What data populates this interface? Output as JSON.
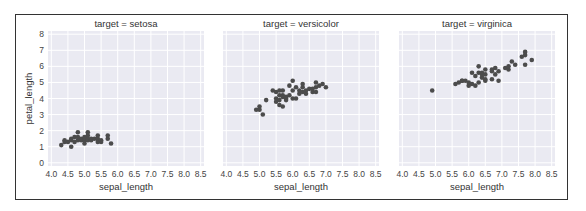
{
  "chart_data": {
    "type": "scatter",
    "layout": "facet-grid 1x3, shared axes",
    "xlabel": "sepal_length",
    "ylabel": "petal_length",
    "xticks": [
      "4.0",
      "4.5",
      "5.0",
      "5.5",
      "6.0",
      "6.5",
      "7.0",
      "7.5",
      "8.0",
      "8.5"
    ],
    "yticks": [
      "0",
      "1",
      "2",
      "3",
      "4",
      "5",
      "6",
      "7",
      "8"
    ],
    "xlim": [
      3.9,
      8.6
    ],
    "ylim": [
      -0.2,
      8.2
    ],
    "grid": true,
    "background": "#eaeaf2",
    "marker_color": "#4c4c4c",
    "panels": [
      {
        "title": "target = setosa",
        "points": [
          [
            4.3,
            1.1
          ],
          [
            4.4,
            1.4
          ],
          [
            4.4,
            1.3
          ],
          [
            4.5,
            1.3
          ],
          [
            4.6,
            1.0
          ],
          [
            4.6,
            1.4
          ],
          [
            4.6,
            1.5
          ],
          [
            4.7,
            1.3
          ],
          [
            4.7,
            1.6
          ],
          [
            4.8,
            1.4
          ],
          [
            4.8,
            1.6
          ],
          [
            4.8,
            1.9
          ],
          [
            4.9,
            1.4
          ],
          [
            4.9,
            1.5
          ],
          [
            5.0,
            1.2
          ],
          [
            5.0,
            1.4
          ],
          [
            5.0,
            1.6
          ],
          [
            5.0,
            1.5
          ],
          [
            5.1,
            1.4
          ],
          [
            5.1,
            1.5
          ],
          [
            5.1,
            1.7
          ],
          [
            5.1,
            1.9
          ],
          [
            5.2,
            1.4
          ],
          [
            5.2,
            1.5
          ],
          [
            5.3,
            1.5
          ],
          [
            5.4,
            1.3
          ],
          [
            5.4,
            1.5
          ],
          [
            5.4,
            1.7
          ],
          [
            5.5,
            1.3
          ],
          [
            5.5,
            1.4
          ],
          [
            5.7,
            1.5
          ],
          [
            5.7,
            1.7
          ],
          [
            5.8,
            1.2
          ]
        ]
      },
      {
        "title": "target = versicolor",
        "points": [
          [
            4.9,
            3.3
          ],
          [
            5.0,
            3.5
          ],
          [
            5.0,
            3.3
          ],
          [
            5.1,
            3.0
          ],
          [
            5.2,
            3.9
          ],
          [
            5.4,
            4.5
          ],
          [
            5.5,
            4.0
          ],
          [
            5.5,
            3.8
          ],
          [
            5.5,
            4.4
          ],
          [
            5.6,
            3.6
          ],
          [
            5.6,
            3.9
          ],
          [
            5.6,
            4.2
          ],
          [
            5.6,
            4.5
          ],
          [
            5.7,
            3.5
          ],
          [
            5.7,
            4.1
          ],
          [
            5.7,
            4.2
          ],
          [
            5.7,
            4.5
          ],
          [
            5.8,
            3.9
          ],
          [
            5.8,
            4.0
          ],
          [
            5.8,
            4.1
          ],
          [
            5.9,
            4.2
          ],
          [
            5.9,
            4.8
          ],
          [
            6.0,
            4.0
          ],
          [
            6.0,
            4.5
          ],
          [
            6.0,
            5.1
          ],
          [
            6.1,
            4.0
          ],
          [
            6.1,
            4.7
          ],
          [
            6.2,
            4.3
          ],
          [
            6.2,
            4.5
          ],
          [
            6.3,
            4.4
          ],
          [
            6.3,
            4.7
          ],
          [
            6.3,
            4.9
          ],
          [
            6.4,
            4.3
          ],
          [
            6.4,
            4.5
          ],
          [
            6.5,
            4.6
          ],
          [
            6.6,
            4.4
          ],
          [
            6.6,
            4.6
          ],
          [
            6.7,
            4.4
          ],
          [
            6.7,
            4.7
          ],
          [
            6.7,
            5.0
          ],
          [
            6.8,
            4.8
          ],
          [
            6.9,
            4.9
          ],
          [
            7.0,
            4.7
          ]
        ]
      },
      {
        "title": "target = virginica",
        "points": [
          [
            4.9,
            4.5
          ],
          [
            5.6,
            4.9
          ],
          [
            5.7,
            5.0
          ],
          [
            5.8,
            5.1
          ],
          [
            5.8,
            5.1
          ],
          [
            5.9,
            5.1
          ],
          [
            6.0,
            4.8
          ],
          [
            6.0,
            5.0
          ],
          [
            6.1,
            4.9
          ],
          [
            6.1,
            5.6
          ],
          [
            6.2,
            4.8
          ],
          [
            6.2,
            5.4
          ],
          [
            6.3,
            5.0
          ],
          [
            6.3,
            5.6
          ],
          [
            6.3,
            6.0
          ],
          [
            6.4,
            5.3
          ],
          [
            6.4,
            5.5
          ],
          [
            6.4,
            5.6
          ],
          [
            6.5,
            5.1
          ],
          [
            6.5,
            5.2
          ],
          [
            6.5,
            5.5
          ],
          [
            6.5,
            5.8
          ],
          [
            6.7,
            5.2
          ],
          [
            6.7,
            5.7
          ],
          [
            6.7,
            5.8
          ],
          [
            6.8,
            5.5
          ],
          [
            6.8,
            5.9
          ],
          [
            6.9,
            5.1
          ],
          [
            6.9,
            5.7
          ],
          [
            7.1,
            5.9
          ],
          [
            7.2,
            5.8
          ],
          [
            7.2,
            6.0
          ],
          [
            7.3,
            6.3
          ],
          [
            7.4,
            6.1
          ],
          [
            7.6,
            6.6
          ],
          [
            7.7,
            6.1
          ],
          [
            7.7,
            6.7
          ],
          [
            7.7,
            6.9
          ],
          [
            7.9,
            6.4
          ]
        ]
      }
    ]
  }
}
